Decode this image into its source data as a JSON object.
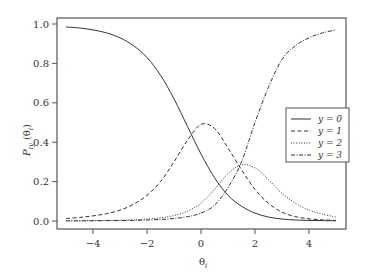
{
  "chart_data": {
    "type": "line",
    "title": "",
    "xlabel": "θ_i",
    "ylabel": "P_iy (θ_i)",
    "xlim": [
      -5.3,
      5.3
    ],
    "ylim": [
      -0.03,
      1.04
    ],
    "grid": false,
    "legend_position": "right-center",
    "x_ticks": [
      -4,
      -2,
      0,
      2,
      4
    ],
    "x_tick_labels": [
      "−4",
      "−2",
      "0",
      "2",
      "4"
    ],
    "y_ticks": [
      0.0,
      0.2,
      0.4,
      0.6,
      0.8,
      1.0
    ],
    "y_tick_labels": [
      "0.0",
      "0.2",
      "0.4",
      "0.6",
      "0.8",
      "1.0"
    ],
    "x": [
      -5,
      -4.5,
      -4,
      -3.5,
      -3,
      -2.5,
      -2,
      -1.5,
      -1,
      -0.5,
      0,
      0.5,
      1,
      1.5,
      2,
      2.5,
      3,
      3.5,
      4,
      4.5,
      5
    ],
    "series": [
      {
        "name": "y = 0",
        "style": "solid",
        "values": [
          0.985,
          0.98,
          0.97,
          0.955,
          0.93,
          0.89,
          0.83,
          0.74,
          0.62,
          0.48,
          0.34,
          0.22,
          0.13,
          0.075,
          0.04,
          0.02,
          0.01,
          0.005,
          0.003,
          0.002,
          0.001
        ]
      },
      {
        "name": "y = 1",
        "style": "dashed",
        "values": [
          0.012,
          0.018,
          0.026,
          0.037,
          0.055,
          0.085,
          0.13,
          0.2,
          0.3,
          0.41,
          0.49,
          0.47,
          0.37,
          0.26,
          0.16,
          0.09,
          0.045,
          0.022,
          0.011,
          0.006,
          0.003
        ]
      },
      {
        "name": "y = 2",
        "style": "dotted",
        "values": [
          0.001,
          0.001,
          0.002,
          0.003,
          0.004,
          0.006,
          0.01,
          0.016,
          0.028,
          0.05,
          0.09,
          0.16,
          0.24,
          0.285,
          0.27,
          0.21,
          0.14,
          0.09,
          0.055,
          0.035,
          0.02
        ]
      },
      {
        "name": "y = 3",
        "style": "dashdot",
        "values": [
          0.001,
          0.001,
          0.001,
          0.002,
          0.002,
          0.003,
          0.005,
          0.008,
          0.013,
          0.022,
          0.04,
          0.08,
          0.17,
          0.3,
          0.5,
          0.68,
          0.82,
          0.89,
          0.93,
          0.955,
          0.97
        ]
      }
    ]
  },
  "axes": {
    "xlabel_main": "θ",
    "xlabel_sub": "i",
    "ylabel_main": "P",
    "ylabel_sub": "iy",
    "ylabel_arg": "(θ",
    "ylabel_arg_sub": "i",
    "ylabel_close": ")"
  },
  "legend": {
    "items": [
      {
        "label": "y = 0",
        "style": "solid"
      },
      {
        "label": "y = 1",
        "style": "dashed"
      },
      {
        "label": "y = 2",
        "style": "dotted"
      },
      {
        "label": "y = 3",
        "style": "dashdot"
      }
    ]
  },
  "colors": {
    "line": "#333333",
    "frame": "#555555"
  }
}
